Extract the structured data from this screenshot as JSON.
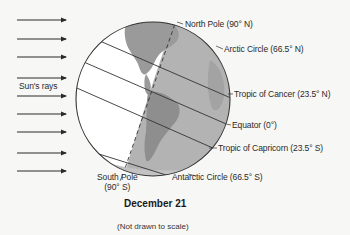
{
  "diagram": {
    "title": "December 21",
    "note": "(Not drawn to scale)",
    "rays_label": "Sun's rays",
    "ray_count": 9,
    "labels": {
      "north_pole": "North Pole (90° N)",
      "arctic_circle": "Arctic Circle (66.5° N)",
      "tropic_cancer": "Tropic of Cancer (23.5° N)",
      "equator": "Equator (0°)",
      "tropic_capricorn": "Tropic of Capricorn (23.5° S)",
      "antarctic_circle": "Antarctic Circle (66.5° S)",
      "south_pole_line1": "South Pole",
      "south_pole_line2": "(90° S)"
    },
    "colors": {
      "night_side": "#a9a9a9",
      "land": "#9a9a9a",
      "day_side": "#ffffff",
      "lines": "#333333"
    }
  }
}
